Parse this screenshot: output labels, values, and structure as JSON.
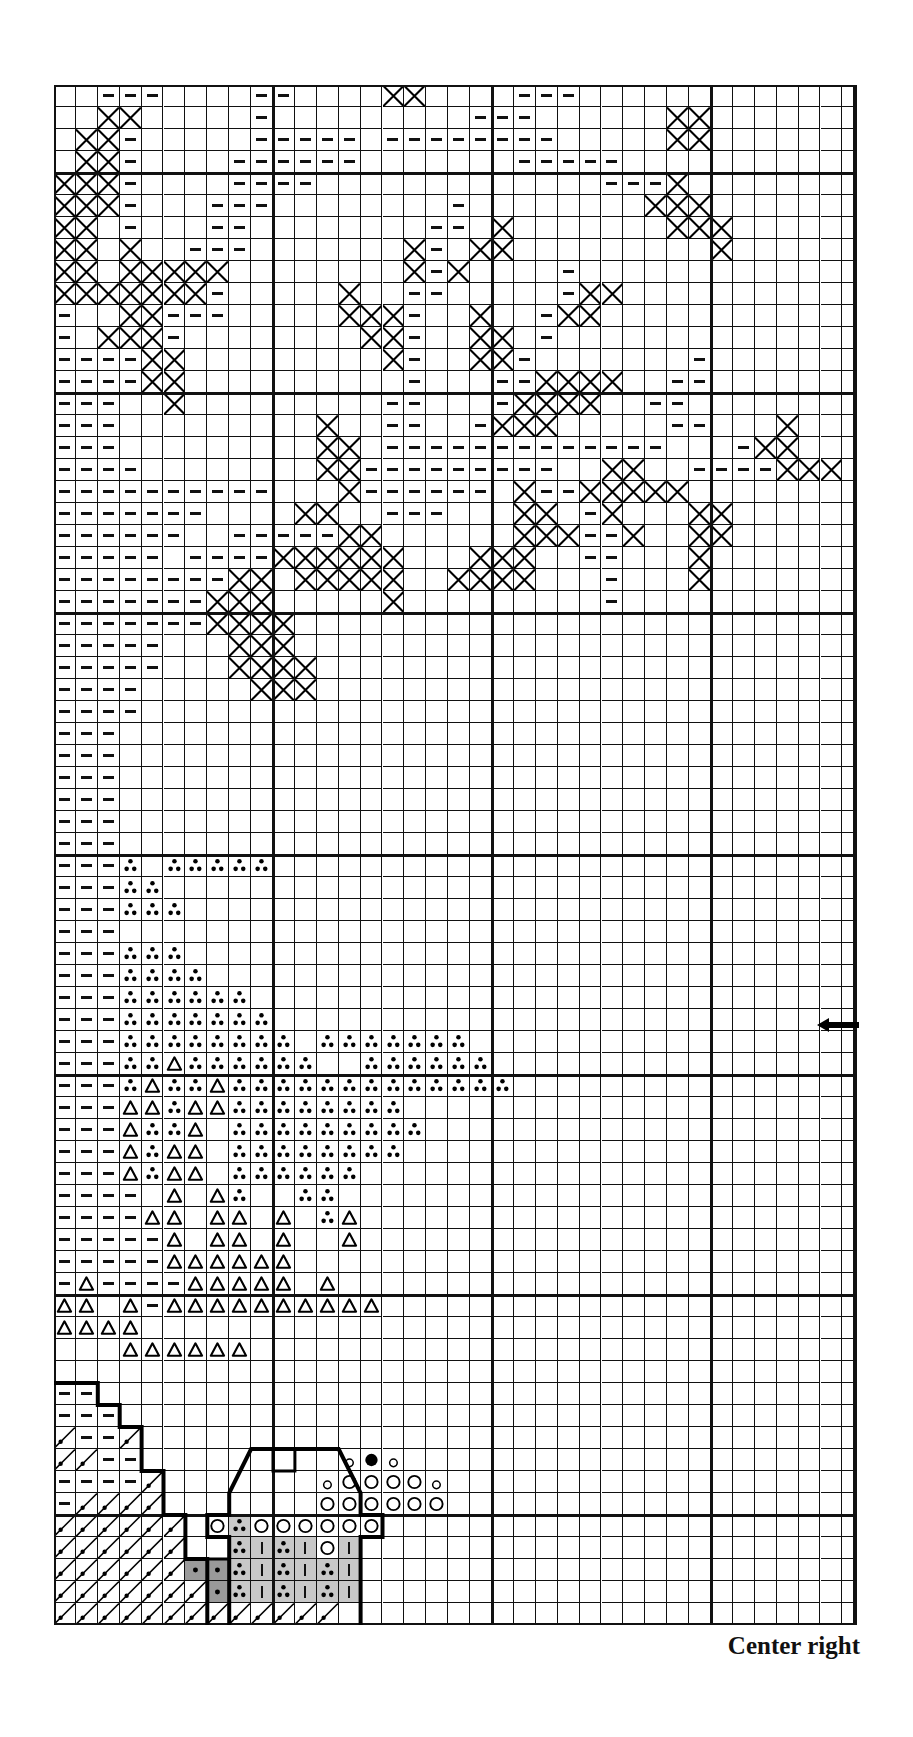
{
  "chart_data": {
    "type": "cross-stitch-pattern",
    "title": "Center right",
    "columns": 37,
    "rows": 70,
    "major_grid_every": 10,
    "legend_symbols": {
      ".": "empty",
      "-": "dash-stitch",
      "X": "cross-stitch",
      "o": "three-dots",
      "^": "triangle",
      "/": "diagonal-with-dot",
      "O": "open-circle",
      "@": "filled-circle",
      "c": "small-circle",
      "%": "three-dots-light-gray",
      "|": "bar-light-gray",
      "*": "dot-dark-gray"
    },
    "center_arrow": {
      "row": 43,
      "direction": "left"
    },
    "grid": [
      "..---....--....XX....---.............",
      "..XX.....-.........---......XX.......",
      ".XX-.....-----.--------.....XX.......",
      ".XX-....------.......-----...........",
      "XXX-....----.............---X........",
      "XXX-...---........-........XXX.......",
      "XX.-...--........--.X.......XXX......",
      "XX.X..---.......X-.XX.........X......",
      "XX.XXXXX........X-X....-.............",
      "XXXXXXX-.....X..--.....-XX...........",
      "-..XX---.....XXX-..X..-XX............",
      "-.XXX-........XX-..XX.-..............",
      "----XX.........X-..XX-.......-.......",
      "----XX..........-...--XXXX..--.......",
      "---..X.........--...-XXXX..--........",
      "---.........X..--..-XXX.....--...X...",
      "---.........XX.-------------...-XX...",
      "----........XX---------..XX..----XXX.",
      "----------...X------.X--XXXXX........",
      "-------....XX..---...XX.-X...XX......",
      "------..-----XX......XXX--X..XX......",
      "-----.----XXXXXX...XXX..--...X.......",
      "--------XX.XXXXX..XXXX...-...X.......",
      "-------XXX.....X.........-...........",
      "-------XXXX..........................",
      "-----...XXX..........................",
      "-----...XXXX.........................",
      "----.....XXX.........................",
      "----.................................",
      "---..................................",
      "---..................................",
      "---..................................",
      "---..................................",
      "---..................................",
      "---..................................",
      "---o.ooooo...........................",
      "---oo................................",
      "---ooo...............................",
      "---..................................",
      "---ooo...............................",
      "---oooo..............................",
      "---oooooo............................",
      "---ooooooo...........................",
      "---oooooooo.ooooooo..................",
      "---oo^oooooo..oooooo.................",
      "---o^oo^ooooooooooooo................",
      "---^^o^^oooooooo.....................",
      "---^oo^.ooooooooo....................",
      "---^o^^.oooooooo.....................",
      "---^o^^.oooooo.......................",
      "----.^.^o..oo........................",
      "----^^.^^.^.o^.......................",
      "-----^.^^.^..^.......................",
      "-----^^^^^^..........................",
      "-^----^^^^^.^........................",
      "^^.^-^^^^^^^^^^......................",
      "^^^^.................................",
      "...^^^^^^............................",
      ".....................................",
      "--...................................",
      "---..................................",
      "/--/.................................",
      "//--.........c@c.....................",
      "----/.......cOOOOc...................",
      "-////.......OOOOOO...................",
      "//////.O%OOOOOO......................",
      "//////..%|%|O|.......................",
      "//////**%|%|%|.......................",
      "///////*%|%|%|.......................",
      "/////////////........................"
    ]
  },
  "caption": {
    "text": "Center right"
  }
}
